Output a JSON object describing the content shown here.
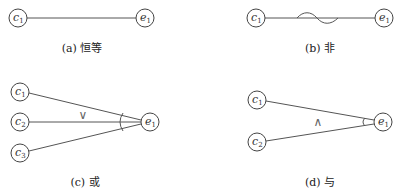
{
  "diagram": {
    "panels": [
      {
        "id": "a",
        "caption": "(a) 恒等",
        "relation": "identity",
        "causes": [
          {
            "name": "c",
            "sub": "1"
          }
        ],
        "effect": {
          "name": "e",
          "sub": "1"
        },
        "operator": ""
      },
      {
        "id": "b",
        "caption": "(b) 非",
        "relation": "negation",
        "causes": [
          {
            "name": "c",
            "sub": "1"
          }
        ],
        "effect": {
          "name": "e",
          "sub": "1"
        },
        "operator": "~"
      },
      {
        "id": "c",
        "caption": "(c) 或",
        "relation": "or",
        "causes": [
          {
            "name": "c",
            "sub": "1"
          },
          {
            "name": "c",
            "sub": "2"
          },
          {
            "name": "c",
            "sub": "3"
          }
        ],
        "effect": {
          "name": "e",
          "sub": "1"
        },
        "operator": "∨"
      },
      {
        "id": "d",
        "caption": "(d) 与",
        "relation": "and",
        "causes": [
          {
            "name": "c",
            "sub": "1"
          },
          {
            "name": "c",
            "sub": "2"
          }
        ],
        "effect": {
          "name": "e",
          "sub": "1"
        },
        "operator": "∧"
      }
    ]
  }
}
